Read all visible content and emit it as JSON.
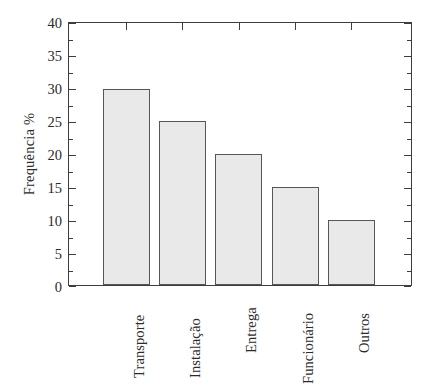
{
  "chart_data": {
    "type": "bar",
    "title": "",
    "subtitle": "",
    "xlabel": "",
    "ylabel": "Frequência %",
    "categories": [
      "Transporte",
      "Instalação",
      "Entrega",
      "Funcionário",
      "Outros"
    ],
    "values": [
      30,
      25,
      20,
      15,
      10
    ],
    "series": [
      {
        "name": "Frequência %",
        "values": [
          30,
          25,
          20,
          15,
          10
        ]
      }
    ],
    "ylim": [
      0,
      40
    ],
    "y_tick_labels": [
      "0",
      "5",
      "10",
      "15",
      "20",
      "25",
      "30",
      "35",
      "40"
    ],
    "y_tick_values": [
      0,
      5,
      10,
      15,
      20,
      25,
      30,
      35,
      40
    ],
    "y_minor_tick_step": 2.5,
    "grid": false,
    "legend": null,
    "legend_position": "none",
    "annotations": [],
    "bar_fill_color": "#e9e9e9",
    "bar_edge_color": "#565656",
    "axis_color": "#3d3d3d",
    "background_color": "#ffffff",
    "x_tick_label_rotation": 90,
    "frame": "full-box-with-inward-ticks"
  }
}
